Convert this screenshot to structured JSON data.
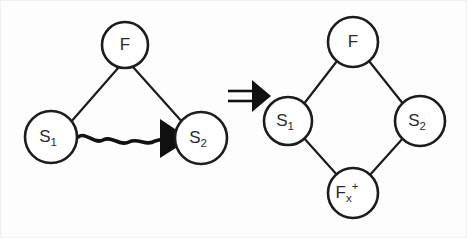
{
  "figure": {
    "background_color": "#fdfdfd",
    "stroke_color": "#1c1c1c",
    "relation_symbol": "=>"
  },
  "left_graph": {
    "name": "left-hand-side-graph",
    "shape": "triangle",
    "nodes": [
      {
        "id": "F",
        "label_base": "F",
        "label_sub": "",
        "label_sup": "",
        "cx": 125,
        "cy": 45,
        "r": 23
      },
      {
        "id": "S1",
        "label_base": "S",
        "label_sub": "1",
        "label_sup": "",
        "cx": 51,
        "cy": 137,
        "r": 26
      },
      {
        "id": "S2",
        "label_base": "S",
        "label_sub": "2",
        "label_sup": "",
        "cx": 201,
        "cy": 138,
        "r": 26
      }
    ],
    "edges": [
      {
        "from": "F",
        "to": "S1",
        "style": "straight"
      },
      {
        "from": "F",
        "to": "S2",
        "style": "straight"
      },
      {
        "from": "S1",
        "to": "S2",
        "style": "wavy-arrow"
      }
    ]
  },
  "right_graph": {
    "name": "right-hand-side-graph",
    "shape": "diamond",
    "nodes": [
      {
        "id": "F",
        "label_base": "F",
        "label_sub": "",
        "label_sup": "",
        "cx": 353,
        "cy": 42,
        "r": 25
      },
      {
        "id": "S1",
        "label_base": "S",
        "label_sub": "1",
        "label_sup": "",
        "cx": 288,
        "cy": 121,
        "r": 24
      },
      {
        "id": "S2",
        "label_base": "S",
        "label_sub": "2",
        "label_sup": "",
        "cx": 420,
        "cy": 121,
        "r": 25
      },
      {
        "id": "Fx+",
        "label_base": "F",
        "label_sub": "x",
        "label_sup": "+",
        "cx": 353,
        "cy": 193,
        "r": 25
      }
    ],
    "edges": [
      {
        "from": "F",
        "to": "S1",
        "style": "straight"
      },
      {
        "from": "F",
        "to": "S2",
        "style": "straight"
      },
      {
        "from": "S1",
        "to": "Fx+",
        "style": "straight"
      },
      {
        "from": "S2",
        "to": "Fx+",
        "style": "straight"
      }
    ]
  },
  "implication": {
    "name": "double-arrow",
    "symbol": "=>",
    "x": 228,
    "y": 96
  }
}
